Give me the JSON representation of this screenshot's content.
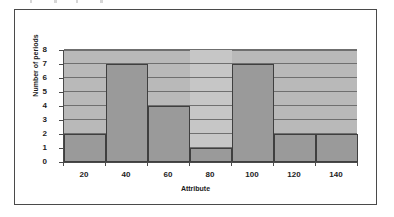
{
  "figure": {
    "background_color": "#ffffff",
    "border_color": "#4a4a4a",
    "plot_background_color": "#b9b9b9",
    "bar_fill_color": "#9a9a9a",
    "bar_border_color": "#3f3f3f",
    "gridline_color": "#6f6f6f"
  },
  "chart_data": {
    "type": "bar",
    "title": "",
    "xlabel": "Attribute",
    "ylabel": "Number of periods",
    "categories": [
      "20",
      "40",
      "60",
      "80",
      "100",
      "120",
      "140"
    ],
    "values": [
      2,
      7,
      4,
      1,
      7,
      2,
      2
    ],
    "bin_edges": [
      10,
      30,
      50,
      70,
      90,
      110,
      130,
      150
    ],
    "bin_width": 20,
    "xlim": [
      10,
      150
    ],
    "ylim": [
      0,
      8
    ],
    "ytick_labels": [
      "0",
      "1",
      "2",
      "3",
      "4",
      "5",
      "6",
      "7",
      "8"
    ],
    "ytick_values": [
      0,
      1,
      2,
      3,
      4,
      5,
      6,
      7,
      8
    ],
    "xtick_labels": [
      "20",
      "40",
      "60",
      "80",
      "100",
      "120",
      "140"
    ],
    "grid": true,
    "grid_axis": "y",
    "legend": false,
    "legend_position": "none"
  }
}
